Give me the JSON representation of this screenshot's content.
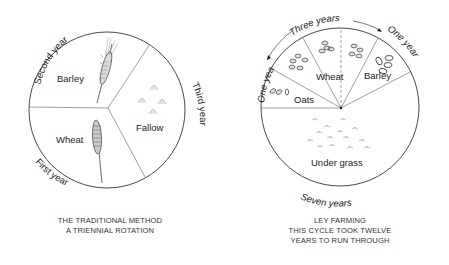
{
  "left_diagram": {
    "sectors": [
      {
        "label": "Barley",
        "year": "Second year"
      },
      {
        "label": "Fallow",
        "year": "Third year"
      },
      {
        "label": "Wheat",
        "year": "First year"
      }
    ],
    "caption": [
      "THE TRADITIONAL METHOD",
      "A TRIENNIAL ROTATION"
    ]
  },
  "right_diagram": {
    "sectors": [
      {
        "label": "Oats"
      },
      {
        "label": "Wheat"
      },
      {
        "label": "Barley"
      },
      {
        "label": "Under grass"
      }
    ],
    "arc_labels": {
      "left_one_year": "One year",
      "three_years": "Three years",
      "right_one_year": "One year",
      "seven_years": "Seven years"
    },
    "caption": [
      "LEY FARMING",
      "THIS CYCLE TOOK TWELVE",
      "YEARS TO RUN THROUGH"
    ]
  },
  "colors": {
    "line": "#333333",
    "divider": "#777777",
    "text": "#222222"
  }
}
